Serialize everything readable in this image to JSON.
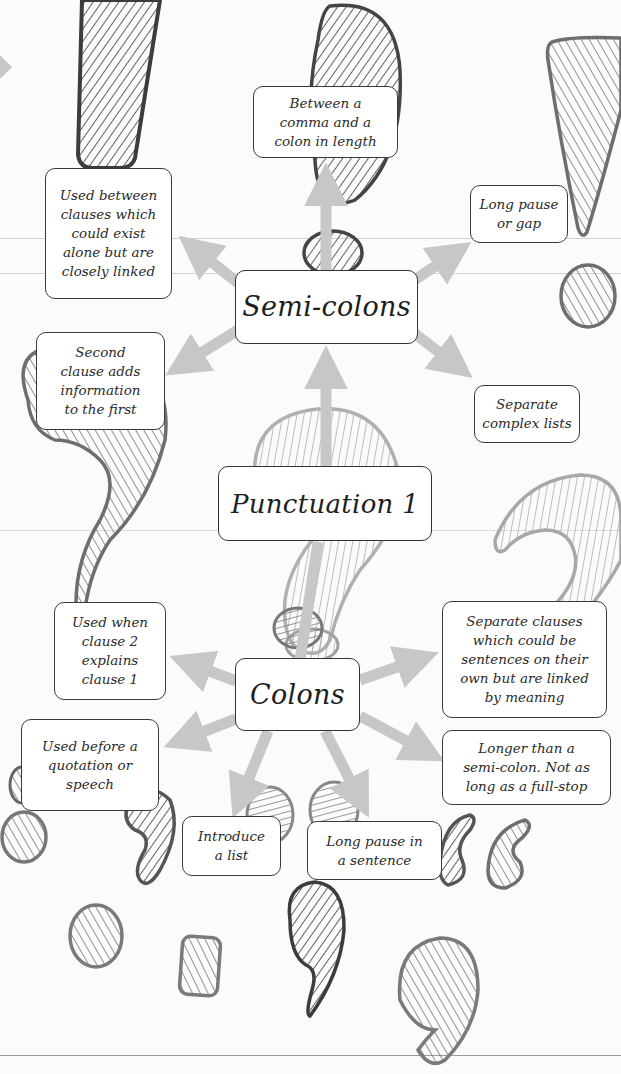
{
  "title": "Punctuation 1",
  "colors": {
    "background": "#fbfbfb",
    "arrow": "#c7c7c7",
    "box_border": "#3a3a3a",
    "shape_dark": "#3c3c3c",
    "shape_mid": "#6e6e6e",
    "shape_light": "#a8a8a8"
  },
  "center": {
    "label": "Punctuation 1"
  },
  "semicolons": {
    "label": "Semi-colons",
    "facts": [
      {
        "id": "length",
        "lines": [
          "Between a",
          "comma and a",
          "colon in length"
        ]
      },
      {
        "id": "clauses",
        "lines": [
          "Used between",
          "clauses which",
          "could exist",
          "alone but are",
          "closely linked"
        ]
      },
      {
        "id": "pause",
        "lines": [
          "Long pause",
          "or gap"
        ]
      },
      {
        "id": "adds-info",
        "lines": [
          "Second",
          "clause adds",
          "information",
          "to the first"
        ]
      },
      {
        "id": "lists",
        "lines": [
          "Separate",
          "complex lists"
        ]
      }
    ]
  },
  "colons": {
    "label": "Colons",
    "facts": [
      {
        "id": "explains",
        "lines": [
          "Used when",
          "clause 2",
          "explains",
          "clause 1"
        ]
      },
      {
        "id": "separate-clauses",
        "lines": [
          "Separate clauses",
          "which could be",
          "sentences on their",
          "own but are linked",
          "by meaning"
        ]
      },
      {
        "id": "quotation",
        "lines": [
          "Used before a",
          "quotation or",
          "speech"
        ]
      },
      {
        "id": "longer",
        "lines": [
          "Longer than a",
          "semi-colon. Not as",
          "long as a full-stop"
        ]
      },
      {
        "id": "list",
        "lines": [
          "Introduce",
          "a list"
        ]
      },
      {
        "id": "pause",
        "lines": [
          "Long pause in",
          "a sentence"
        ]
      }
    ]
  },
  "decorations": [
    "exclamation-mark-icon",
    "semicolon-icon",
    "exclamation-mark-icon",
    "question-mark-icon",
    "question-mark-icon",
    "question-mark-icon",
    "colon-icon",
    "quotation-mark-icon",
    "full-stop-icon",
    "comma-icon"
  ]
}
